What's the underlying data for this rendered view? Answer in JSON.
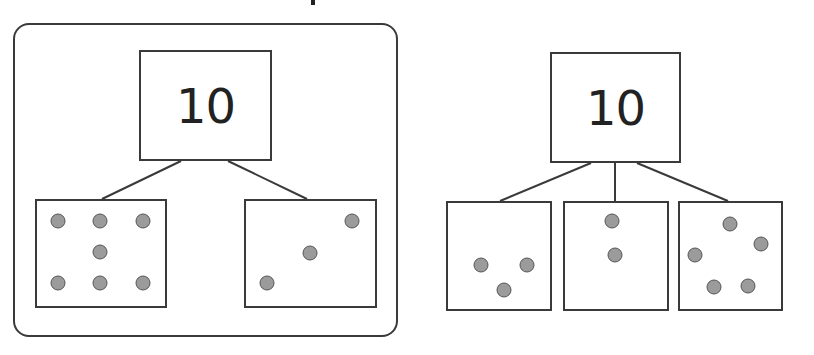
{
  "title_fragment": "",
  "colors": {
    "stroke": "#3a3a3a",
    "dot_fill": "#9b9b9b",
    "dot_stroke": "#555555",
    "text": "#222222"
  },
  "diagrams": [
    {
      "whole": {
        "value": "10"
      },
      "parts": [
        {
          "dot_count": 7
        },
        {
          "dot_count": 3
        }
      ]
    },
    {
      "whole": {
        "value": "10"
      },
      "parts": [
        {
          "dot_count": 3
        },
        {
          "dot_count": 2
        },
        {
          "dot_count": 5
        }
      ]
    }
  ]
}
